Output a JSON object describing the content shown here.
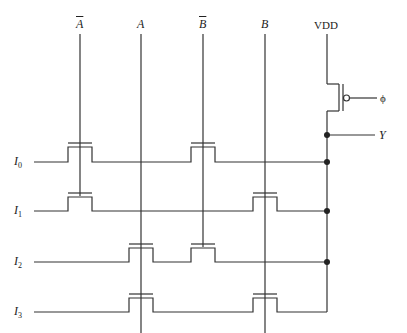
{
  "diagram": {
    "type": "NMOS multiplexer / decoder circuit with precharge PMOS",
    "columns": [
      {
        "id": "Abar",
        "label": "A",
        "overline": true,
        "x": 80
      },
      {
        "id": "A",
        "label": "A",
        "overline": false,
        "x": 141
      },
      {
        "id": "Bbar",
        "label": "B",
        "overline": true,
        "x": 203
      },
      {
        "id": "B",
        "label": "B",
        "overline": false,
        "x": 265
      }
    ],
    "supply": {
      "label": "VDD",
      "x": 327
    },
    "clock": {
      "label": "ϕ"
    },
    "output": {
      "label": "Y"
    },
    "inputs": [
      {
        "label": "I",
        "sub": "0",
        "y": 162
      },
      {
        "label": "I",
        "sub": "1",
        "y": 211
      },
      {
        "label": "I",
        "sub": "2",
        "y": 262
      },
      {
        "label": "I",
        "sub": "3",
        "y": 312
      }
    ],
    "transistors": [
      {
        "input": "I0",
        "gate": "Abar"
      },
      {
        "input": "I0",
        "gate": "Bbar"
      },
      {
        "input": "I1",
        "gate": "Abar"
      },
      {
        "input": "I1",
        "gate": "B"
      },
      {
        "input": "I2",
        "gate": "A"
      },
      {
        "input": "I2",
        "gate": "Bbar"
      },
      {
        "input": "I3",
        "gate": "A"
      },
      {
        "input": "I3",
        "gate": "B"
      }
    ],
    "colors": {
      "line": "#333333",
      "background": "#ffffff"
    }
  }
}
